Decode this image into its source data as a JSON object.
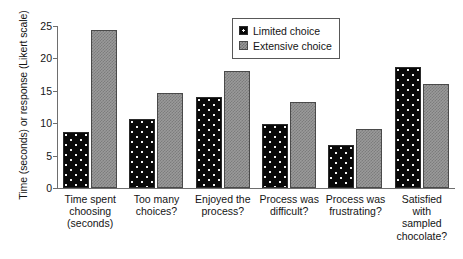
{
  "chart_data": {
    "type": "bar",
    "title": "",
    "xlabel": "",
    "ylabel": "Time (seconds) or response (Likert scale)",
    "ylim": [
      0,
      25
    ],
    "ytick_step": 5,
    "yticks": [
      25,
      20,
      15,
      10,
      5,
      0
    ],
    "grid": false,
    "legend_position": "top-right",
    "categories": [
      "Time spent choosing (seconds)",
      "Too many choices?",
      "Enjoyed the process?",
      "Process was difficult?",
      "Process was frustrating?",
      "Satisfied with sampled chocolate?"
    ],
    "category_lines": [
      [
        "Time spent",
        "choosing",
        "(seconds)"
      ],
      [
        "Too many",
        "choices?"
      ],
      [
        "Enjoyed the",
        "process?"
      ],
      [
        "Process was",
        "difficult?"
      ],
      [
        "Process was",
        "frustrating?"
      ],
      [
        "Satisfied",
        "with",
        "sampled",
        "chocolate?"
      ]
    ],
    "series": [
      {
        "name": "Limited choice",
        "values": [
          8.6,
          10.6,
          14.1,
          9.9,
          6.6,
          18.6
        ],
        "color": "#090909",
        "pattern": "dotted"
      },
      {
        "name": "Extensive choice",
        "values": [
          24.4,
          14.6,
          18.0,
          13.3,
          9.1,
          16.1
        ],
        "color": "#9a9a9a",
        "pattern": "checkered"
      }
    ]
  },
  "legend": {
    "items": [
      {
        "label": "Limited choice"
      },
      {
        "label": "Extensive choice"
      }
    ]
  }
}
